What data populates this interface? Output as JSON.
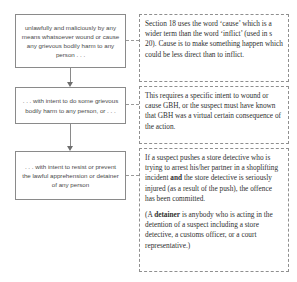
{
  "diagram": {
    "colors": {
      "box_border": "#8a8a8a",
      "note_border": "#8f8f8f",
      "arrow": "#6e6e6e",
      "box_text": "#4a4a4a",
      "note_text": "#2f2f2f",
      "background": "#ffffff"
    },
    "flow_boxes": [
      {
        "id": "box-1",
        "text": "unlawfully and maliciously by any means whatsoever wound or cause any grievous bodily harm to any person . . ."
      },
      {
        "id": "box-2",
        "text": ". . . with intent to do some grievous bodily harm to any person, or . . ."
      },
      {
        "id": "box-3",
        "text": ". . . with intent to resist or prevent the lawful apprehension or detainer of any person"
      }
    ],
    "notes": [
      {
        "id": "note-1",
        "paragraphs": [
          {
            "runs": [
              {
                "text": "Section 18 uses the word ‘cause’ which is a wider term than the word ‘inflict’ (used in s 20). Cause is to make something happen which could be less direct than to inflict.",
                "bold": false
              }
            ]
          }
        ]
      },
      {
        "id": "note-2",
        "paragraphs": [
          {
            "runs": [
              {
                "text": "This requires a specific intent to wound or cause GBH, or the suspect must have known that GBH was a virtual certain consequence of the action.",
                "bold": false
              }
            ]
          }
        ]
      },
      {
        "id": "note-3",
        "paragraphs": [
          {
            "runs": [
              {
                "text": "If a suspect pushes a store detective who is trying to arrest his/her partner in a shoplifting incident ",
                "bold": false
              },
              {
                "text": "and",
                "bold": true
              },
              {
                "text": " the store detective is seriously injured (as a result of the push), the offence has been committed.",
                "bold": false
              }
            ]
          },
          {
            "runs": [
              {
                "text": "(A ",
                "bold": false
              },
              {
                "text": "detainer",
                "bold": true
              },
              {
                "text": " is anybody who is acting in the detention of a suspect including a store detective, a customs officer, or a court representative.)",
                "bold": false
              }
            ]
          }
        ]
      }
    ],
    "arrows": [
      {
        "id": "arrow-1",
        "from": "box-1",
        "to": "box-2"
      },
      {
        "id": "arrow-2",
        "from": "box-2",
        "to": "box-3"
      }
    ],
    "connectors": [
      {
        "id": "link-1",
        "from": "box-1",
        "to": "note-1"
      },
      {
        "id": "link-2",
        "from": "box-2",
        "to": "note-2"
      },
      {
        "id": "link-3",
        "from": "box-3",
        "to": "note-3"
      }
    ]
  }
}
